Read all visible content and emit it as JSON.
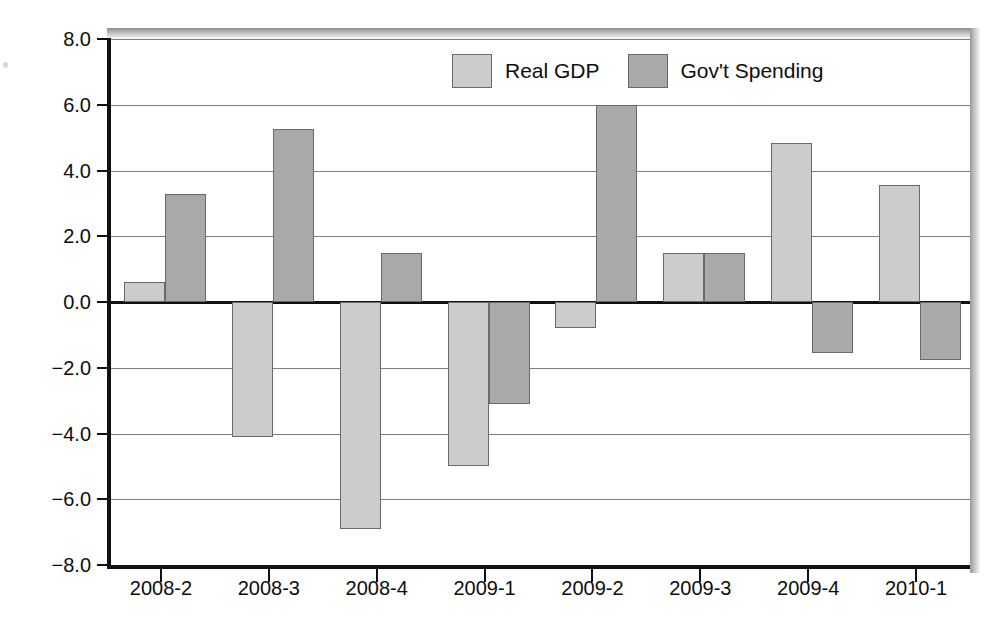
{
  "chart_data": {
    "type": "bar",
    "title_visible_fragment": "",
    "xlabel": "",
    "ylabel": "",
    "categories": [
      "2008-2",
      "2008-3",
      "2008-4",
      "2009-1",
      "2009-2",
      "2009-3",
      "2009-4",
      "2010-1"
    ],
    "series": [
      {
        "name": "Real GDP",
        "color": "#cccccc",
        "values": [
          0.6,
          -4.1,
          -6.9,
          -5.0,
          -0.8,
          1.5,
          4.85,
          3.55
        ]
      },
      {
        "name": "Gov't Spending",
        "color": "#a9a9a9",
        "values": [
          3.3,
          5.25,
          1.5,
          -3.1,
          6.0,
          1.5,
          -1.55,
          -1.75
        ]
      }
    ],
    "ylim": [
      -8.0,
      8.0
    ],
    "ytick_labels": [
      "8.0",
      "6.0",
      "4.0",
      "2.0",
      "0.0",
      "−2.0",
      "−4.0",
      "−6.0",
      "−8.0"
    ],
    "ytick_values": [
      8,
      6,
      4,
      2,
      0,
      -2,
      -4,
      -6,
      -8
    ],
    "grid": true,
    "legend_position": "top-center"
  },
  "legend": {
    "items": [
      {
        "label": "Real GDP",
        "color": "#cccccc"
      },
      {
        "label": "Gov't Spending",
        "color": "#a9a9a9"
      }
    ]
  },
  "colors": {
    "gdp": "#cccccc",
    "gov": "#a9a9a9",
    "axis": "#111111",
    "grid": "#7d7d7d",
    "background": "#ffffff"
  }
}
